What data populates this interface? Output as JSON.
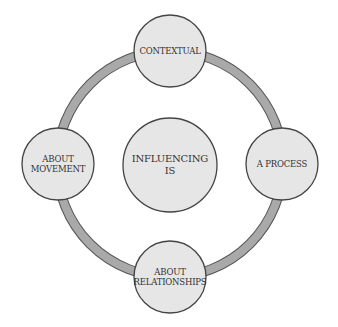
{
  "diagram": {
    "center": {
      "lines": [
        "INFLUENCING",
        "IS"
      ]
    },
    "nodes": [
      {
        "id": "top",
        "lines": [
          "CONTEXTUAL"
        ]
      },
      {
        "id": "right",
        "lines": [
          "A PROCESS"
        ]
      },
      {
        "id": "bottom",
        "lines": [
          "ABOUT",
          "RELATIONSHIPS"
        ]
      },
      {
        "id": "left",
        "lines": [
          "ABOUT",
          "MOVEMENT"
        ]
      }
    ],
    "colors": {
      "ring_fill": "#a9a9a9",
      "ring_stroke": "#555555",
      "circle_fill": "#e6e6e6",
      "circle_stroke": "#444444",
      "text": "#333333"
    }
  }
}
